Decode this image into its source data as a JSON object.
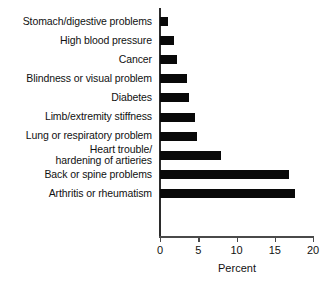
{
  "chart_data": {
    "type": "bar",
    "orientation": "horizontal",
    "title": "",
    "xlabel": "Percent",
    "ylabel": "",
    "xlim": [
      0,
      20
    ],
    "xticks": [
      0,
      5,
      10,
      15,
      20
    ],
    "xtick_labels": [
      "0",
      "5",
      "10",
      "15",
      "20"
    ],
    "grid": false,
    "legend": false,
    "bar_color": "#090909",
    "axis_color": "#4a4a4a",
    "categories": [
      "Stomach/digestive problems",
      "High blood pressure",
      "Cancer",
      "Blindness or visual problem",
      "Diabetes",
      "Limb/extremity stiffness",
      "Lung or respiratory problem",
      "Heart trouble/\nhardening of artieries",
      "Back or spine problems",
      "Arthritis or rheumatism"
    ],
    "values": [
      1.0,
      1.8,
      2.2,
      3.5,
      3.8,
      4.6,
      4.9,
      8.0,
      16.8,
      17.6
    ]
  }
}
